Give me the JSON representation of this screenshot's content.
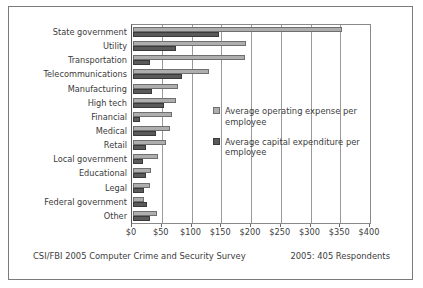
{
  "chart_data": {
    "type": "bar",
    "orientation": "horizontal",
    "title": "",
    "xlabel": "",
    "ylabel": "",
    "xlim": [
      0,
      400
    ],
    "xticks": [
      0,
      50,
      100,
      150,
      200,
      250,
      300,
      350,
      400
    ],
    "xticklabels": [
      "$0",
      "$50",
      "$100",
      "$150",
      "$200",
      "$250",
      "$300",
      "$350",
      "$400"
    ],
    "grid": true,
    "grid_axis": "x",
    "legend_position": "center-right inside plot",
    "categories": [
      "State government",
      "Utility",
      "Transportation",
      "Telecommunications",
      "Manufacturing",
      "High tech",
      "Financial",
      "Medical",
      "Retail",
      "Local government",
      "Educational",
      "Legal",
      "Federal government",
      "Other"
    ],
    "series": [
      {
        "name": "Average operating expense per employee",
        "color": "#aeaeae",
        "values": [
          352,
          190,
          188,
          128,
          75,
          72,
          65,
          62,
          55,
          42,
          30,
          28,
          18,
          40
        ]
      },
      {
        "name": "Average capital expenditure per employee",
        "color": "#5a5a5a",
        "values": [
          145,
          72,
          28,
          82,
          32,
          52,
          12,
          38,
          22,
          17,
          22,
          18,
          23,
          28
        ]
      }
    ]
  },
  "legend": {
    "entries": [
      {
        "label": "Average operating expense per employee",
        "swatch": "light-gray-square"
      },
      {
        "label": "Average capital expenditure per employee",
        "swatch": "dark-gray-square"
      }
    ]
  },
  "footer": {
    "left": "CSI/FBI 2005 Computer Crime and Security Survey",
    "right": "2005: 405 Respondents"
  },
  "colors": {
    "operating_expense": "#aeaeae",
    "capital_expenditure": "#5a5a5a",
    "frame": "#7b7b7b",
    "gridline": "#9a9a9a",
    "text": "#3c3c3c"
  }
}
